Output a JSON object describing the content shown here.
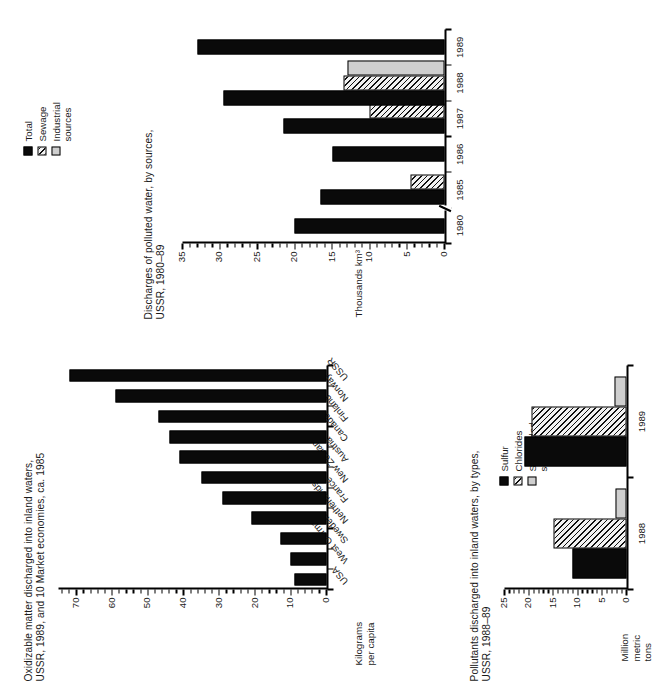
{
  "page": {
    "orientation": "rotated-90-ccw",
    "background": "#ffffff",
    "ink": "#000000"
  },
  "charts": [
    {
      "id": "oxidizable-matter",
      "title": "Oxidizable matter discharged into inland waters,\nUSSR, 1989, and 10 Market economies, ca. 1985",
      "ylabel": "Kilograms\nper capita",
      "chart_data": {
        "type": "bar",
        "title": "Oxidizable matter discharged into inland waters, USSR, 1989, and 10 Market economies, ca. 1985",
        "xlabel": "",
        "ylabel": "Kilograms per capita",
        "ylim": [
          0,
          75
        ],
        "yticks": [
          0,
          10,
          20,
          30,
          40,
          50,
          60,
          70
        ],
        "minor_tick_step": 2,
        "grid": false,
        "legend": "none",
        "orientation": "vertical",
        "categories": [
          "USA",
          "West Germany",
          "Sweden",
          "Netherlands",
          "France",
          "New Zealand",
          "Austria",
          "Canada",
          "Finland",
          "Norway",
          "USSR"
        ],
        "values": [
          9,
          10,
          13,
          21,
          29,
          35,
          41,
          44,
          47,
          59,
          72
        ]
      }
    },
    {
      "id": "pollutants-by-type",
      "title": "Pollutants discharged into inland waters, by types,\nUSSR, 1988–89",
      "ylabel": "Million\nmetric\ntons",
      "legend_title": "",
      "chart_data": {
        "type": "bar",
        "title": "Pollutants discharged into inland waters, by types, USSR, 1988–89",
        "xlabel": "",
        "ylabel": "Million metric tons",
        "ylim": [
          0,
          25
        ],
        "yticks": [
          0,
          5,
          10,
          15,
          20,
          25
        ],
        "minor_tick_step": 1,
        "grid": false,
        "legend_position": "top-right",
        "orientation": "vertical",
        "categories": [
          "1988",
          "1989"
        ],
        "series": [
          {
            "name": "Sulfur",
            "fill": "black",
            "values": [
              11,
              21
            ]
          },
          {
            "name": "Chlorides",
            "fill": "hatch",
            "values": [
              15,
              19.5
            ]
          },
          {
            "name": "Suspended solids",
            "fill": "gray",
            "values": [
              2.3,
              2.4
            ]
          }
        ]
      }
    },
    {
      "id": "discharges-polluted-water",
      "title": "Discharges of polluted water, by sources,\nUSSR, 1980–89",
      "ylabel": "Thousands km³",
      "chart_data": {
        "type": "bar",
        "title": "Discharges of polluted water, by sources, USSR, 1980–89",
        "xlabel": "",
        "ylabel": "Thousands km³",
        "ylim": [
          0,
          35
        ],
        "yticks": [
          0,
          5,
          10,
          15,
          20,
          25,
          30,
          35
        ],
        "minor_tick_step": 1,
        "grid": false,
        "axis_break_after_category": "1980",
        "legend_position": "top-right",
        "orientation": "vertical",
        "categories": [
          "1980",
          "1985",
          "1986",
          "1987",
          "1988",
          "1989"
        ],
        "series": [
          {
            "name": "Total",
            "fill": "black",
            "values": [
              20,
              16.5,
              15,
              21.5,
              29.5,
              33
            ]
          },
          {
            "name": "Sewage",
            "fill": "hatch",
            "values": [
              null,
              4.5,
              null,
              10,
              13.5,
              null
            ]
          },
          {
            "name": "Industrial sources",
            "fill": "gray",
            "values": [
              null,
              null,
              null,
              null,
              13,
              null
            ]
          }
        ]
      }
    }
  ],
  "legends": {
    "pollutants": [
      {
        "label": "Sulfur",
        "fill": "black"
      },
      {
        "label": "Chlorides",
        "fill": "hatch"
      },
      {
        "label": "Suspended\nsolids",
        "fill": "gray"
      }
    ],
    "discharges": [
      {
        "label": "Total",
        "fill": "black"
      },
      {
        "label": "Sewage",
        "fill": "hatch"
      },
      {
        "label": "Industrial\nsources",
        "fill": "gray"
      }
    ]
  }
}
